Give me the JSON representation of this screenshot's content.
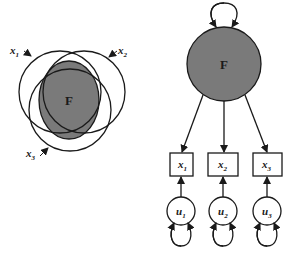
{
  "left_panel": {
    "factor_label": "F",
    "indicators": [
      {
        "label": "x",
        "sub": "1"
      },
      {
        "label": "x",
        "sub": "2"
      },
      {
        "label": "x",
        "sub": "3"
      }
    ]
  },
  "right_panel": {
    "factor_label": "F",
    "indicators": [
      {
        "label": "x",
        "sub": "1"
      },
      {
        "label": "x",
        "sub": "2"
      },
      {
        "label": "x",
        "sub": "3"
      }
    ],
    "uniquenesses": [
      {
        "label": "u",
        "sub": "1"
      },
      {
        "label": "u",
        "sub": "2"
      },
      {
        "label": "u",
        "sub": "3"
      }
    ]
  },
  "colors": {
    "factor_fill": "#7a7a7a",
    "stroke": "#1a1a1a",
    "background": "#ffffff"
  }
}
